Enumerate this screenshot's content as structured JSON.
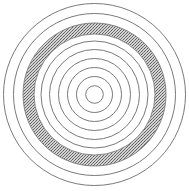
{
  "figure": {
    "title": "",
    "type": "concentric-circles",
    "center": [
      94.5,
      94.5
    ],
    "line_color": "#7a7a7a",
    "band_fill_dark": "#6e6e6e",
    "band_fill_light": "#cfcfcf",
    "background": "#ffffff"
  },
  "rings": [
    {
      "r": 8.8
    },
    {
      "r": 18
    },
    {
      "r": 27
    },
    {
      "r": 36
    },
    {
      "r": 45
    },
    {
      "r": 53.5
    }
  ],
  "band": {
    "inner_r": 60.5,
    "outer_r": 71.5,
    "pattern": "stipple"
  },
  "outer_rings": [
    {
      "r": 81
    },
    {
      "r": 91
    }
  ]
}
